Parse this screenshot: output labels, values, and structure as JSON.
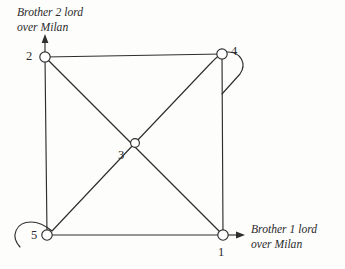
{
  "figure": {
    "background_color": "#fdfdfc",
    "line_color": "#2e2e2e",
    "node_fill_color": "#ffffff"
  },
  "nodes": [
    {
      "id": "1",
      "label": "1",
      "x": 223,
      "y": 235,
      "r": 5.2
    },
    {
      "id": "2",
      "label": "2",
      "x": 45,
      "y": 57,
      "r": 5.2
    },
    {
      "id": "3",
      "label": "3",
      "x": 135,
      "y": 143,
      "r": 4.4
    },
    {
      "id": "4",
      "label": "4",
      "x": 222,
      "y": 54,
      "r": 5.2
    },
    {
      "id": "5",
      "label": "5",
      "x": 47,
      "y": 235,
      "r": 5.2
    }
  ],
  "edges": [
    {
      "from": "2",
      "to": "4",
      "kind": "straight",
      "name": "edge-2-4"
    },
    {
      "from": "4",
      "to": "1",
      "kind": "straight",
      "name": "edge-4-1"
    },
    {
      "from": "5",
      "to": "1",
      "kind": "straight",
      "name": "edge-5-1"
    },
    {
      "from": "2",
      "to": "5",
      "kind": "straight",
      "name": "edge-2-5"
    },
    {
      "from": "2",
      "to": "1",
      "kind": "straight",
      "name": "edge-2-1-diagonal"
    },
    {
      "from": "5",
      "to": "4",
      "kind": "curved-loop",
      "name": "edge-5-4-diagonal"
    }
  ],
  "arrows": [
    {
      "name": "arrow-node-2-up",
      "direction": "up",
      "at_node": "2"
    },
    {
      "name": "arrow-node-1-right",
      "direction": "right",
      "at_node": "1"
    }
  ],
  "annotations": {
    "top_left": "Brother 2 lord\nover Milan",
    "bottom_right": "Brother 1 lord\nover Milan"
  }
}
